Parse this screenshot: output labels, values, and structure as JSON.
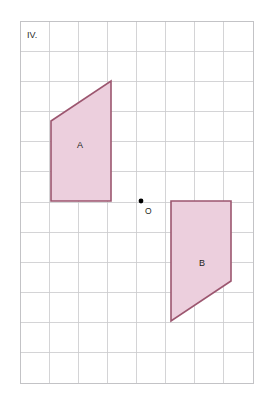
{
  "figure": {
    "label": "IV.",
    "background_color": "#ffffff",
    "grid": {
      "line_color": "#c9c9cc",
      "border_color": "#bcbcc0",
      "x0": 20,
      "y0": 21,
      "cols": 8,
      "rows": 12,
      "cell_width": 29.125,
      "cell_height": 30.1667
    },
    "style": {
      "shape_fill": "#eccfdd",
      "shape_stroke": "#9c566f",
      "point_color": "#000000",
      "text_color": "#231f20"
    },
    "center_point": {
      "name": "O",
      "label": "O",
      "x": 141,
      "y": 201,
      "radius": 2.4,
      "label_x": 145,
      "label_y": 214
    },
    "shapes": [
      {
        "id": "A",
        "label": "A",
        "type": "trapezoid",
        "points": "51,121 111,81 111,201 51,201",
        "label_x": 80,
        "label_y": 148
      },
      {
        "id": "B",
        "label": "B",
        "type": "trapezoid",
        "points": "231,281 171,321 171,201 231,201",
        "label_x": 202,
        "label_y": 266
      }
    ]
  },
  "chart_data": {
    "type": "diagram",
    "title": "IV.",
    "grid": {
      "columns": 8,
      "rows": 12
    },
    "center_of_rotation": {
      "label": "O",
      "grid_x": 4,
      "grid_y": 6
    },
    "shapes": [
      {
        "label": "A",
        "vertices_grid": [
          [
            1.06,
            3.31
          ],
          [
            3.12,
            1.99
          ],
          [
            3.12,
            5.96
          ],
          [
            1.06,
            5.96
          ]
        ]
      },
      {
        "label": "B",
        "vertices_grid": [
          [
            7.25,
            8.62
          ],
          [
            5.18,
            9.94
          ],
          [
            5.18,
            5.96
          ],
          [
            7.25,
            5.96
          ]
        ]
      }
    ]
  }
}
